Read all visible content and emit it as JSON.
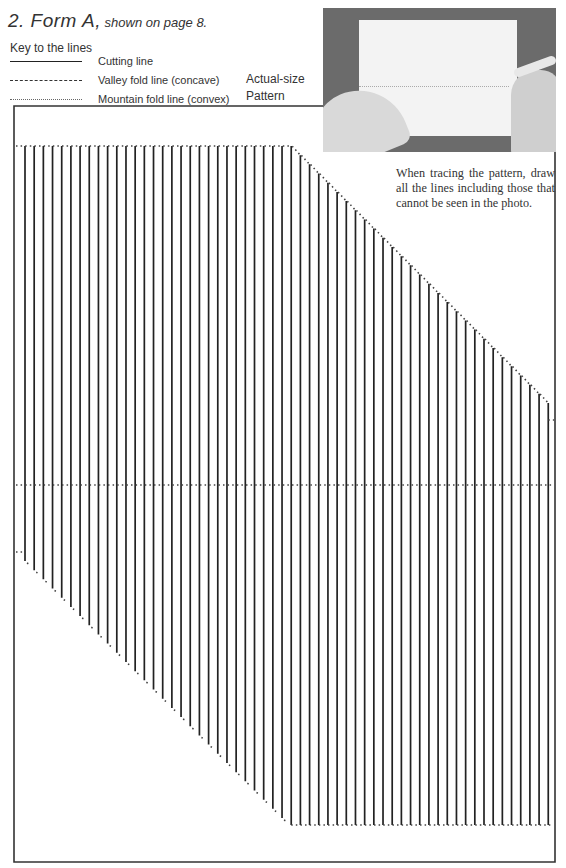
{
  "header": {
    "number_title": "2. Form A,",
    "subtitle": " shown on page 8."
  },
  "key": {
    "heading": "Key to the lines",
    "items": [
      {
        "style": "cut",
        "label": "Cutting line"
      },
      {
        "style": "valley",
        "label": "Valley fold line (concave)"
      },
      {
        "style": "mountain",
        "label": "Mountain fold line (convex)"
      }
    ]
  },
  "pattern_label": {
    "line1": "Actual-size",
    "line2": "Pattern"
  },
  "photo": {
    "description": "hands tracing pattern onto paper"
  },
  "note": "When tracing the pattern, draw all the lines including those that cannot be seen in the photo.",
  "colors": {
    "ink": "#222222",
    "dot": "#444444",
    "border": "#333333"
  },
  "pattern": {
    "border": {
      "left": 14,
      "top": 106,
      "right": 555,
      "bottom": 862,
      "top_right_end": 323
    },
    "first_line_x": 25,
    "spacing": 9.18,
    "line_count": 58,
    "top_flat_y": 146,
    "top_flat_count": 30,
    "bottom_flat_y": 825,
    "bottom_start_y": 561,
    "step": 9.18,
    "middle_fold_y": 485,
    "left_stub_y": 552,
    "right_stub_y": 420
  }
}
